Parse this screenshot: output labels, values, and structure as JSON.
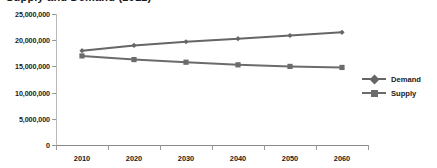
{
  "chart_data": {
    "type": "line",
    "title": "Supply and Demand (2012)",
    "xlabel": "",
    "ylabel": "",
    "categories": [
      "2010",
      "2020",
      "2030",
      "2040",
      "2050",
      "2060"
    ],
    "x": [
      2010,
      2020,
      2030,
      2040,
      2050,
      2060
    ],
    "series": [
      {
        "name": "Demand",
        "marker": "diamond",
        "color": "#666666",
        "values": [
          18000000,
          19000000,
          19700000,
          20300000,
          20900000,
          21500000
        ]
      },
      {
        "name": "Supply",
        "marker": "square",
        "color": "#6b6b6b",
        "values": [
          17000000,
          16300000,
          15800000,
          15300000,
          15000000,
          14800000
        ]
      }
    ],
    "ylim": [
      0,
      25000000
    ],
    "yticks": [
      0,
      5000000,
      10000000,
      15000000,
      20000000,
      25000000
    ],
    "ytick_labels": [
      "0",
      "5,000,000",
      "10,000,000",
      "15,000,000",
      "20,000,000",
      "25,000,000"
    ],
    "grid": false,
    "legend_position": "right"
  },
  "legend": {
    "entries": [
      {
        "label": "Demand"
      },
      {
        "label": "Supply"
      }
    ]
  },
  "colors": {
    "demand_line": "#666666",
    "supply_line": "#6b6b6b",
    "axis": "#8a8a8a",
    "text": "#1a1a1a",
    "background": "#ffffff"
  }
}
